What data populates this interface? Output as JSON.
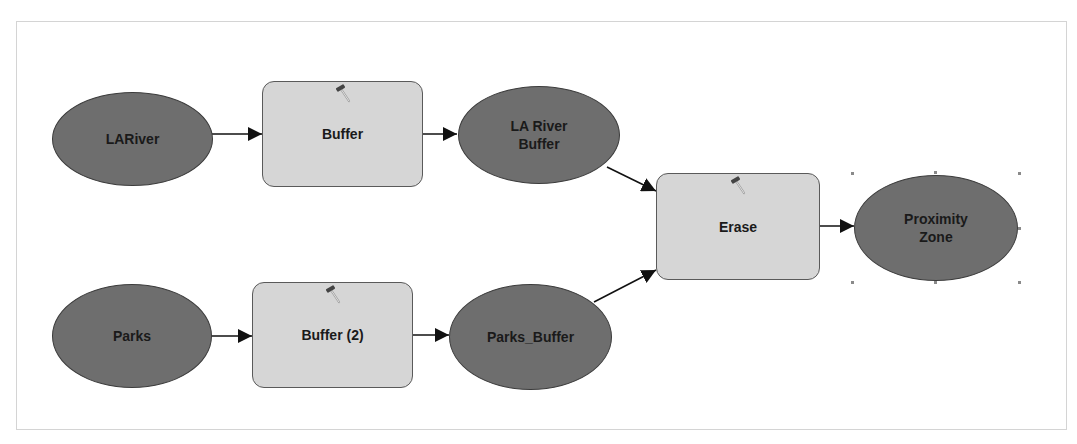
{
  "model": {
    "nodes": [
      {
        "id": "lariver",
        "type": "data",
        "label": "LARiver"
      },
      {
        "id": "buffer1",
        "type": "tool",
        "label": "Buffer",
        "icon": "hammer-icon"
      },
      {
        "id": "lariver_buffer",
        "type": "data",
        "label": "LA River\nBuffer"
      },
      {
        "id": "parks",
        "type": "data",
        "label": "Parks"
      },
      {
        "id": "buffer2",
        "type": "tool",
        "label": "Buffer (2)",
        "icon": "hammer-icon"
      },
      {
        "id": "parks_buffer",
        "type": "data",
        "label": "Parks_Buffer"
      },
      {
        "id": "erase",
        "type": "tool",
        "label": "Erase",
        "icon": "hammer-icon"
      },
      {
        "id": "proximity_zone",
        "type": "data",
        "label": "Proximity\nZone",
        "selected": true
      }
    ],
    "edges": [
      {
        "from": "LARiver",
        "to": "Buffer"
      },
      {
        "from": "Buffer",
        "to": "LA River Buffer"
      },
      {
        "from": "LA River Buffer",
        "to": "Erase"
      },
      {
        "from": "Parks",
        "to": "Buffer (2)"
      },
      {
        "from": "Buffer (2)",
        "to": "Parks_Buffer"
      },
      {
        "from": "Parks_Buffer",
        "to": "Erase"
      },
      {
        "from": "Erase",
        "to": "Proximity Zone"
      }
    ]
  },
  "colors": {
    "data_fill": "#6e6e6e",
    "tool_fill": "#d6d6d6",
    "edge": "#111111",
    "canvas_border": "#d4d4d4"
  }
}
